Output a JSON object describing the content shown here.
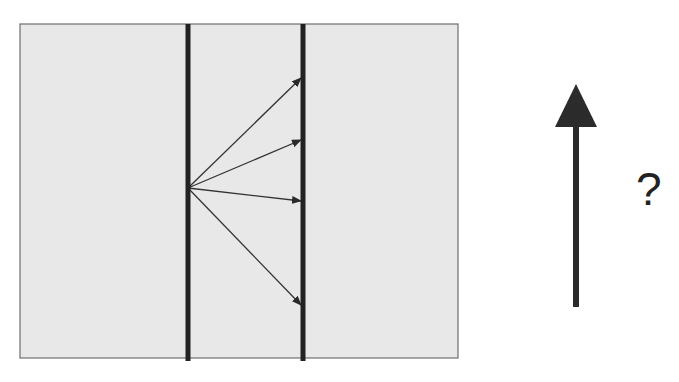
{
  "diagram": {
    "title": "",
    "colors": {
      "background": "#ffffff",
      "panel_fill": "#e8e8e8",
      "panel_border": "#6e6e6e",
      "barrier_line": "#222222",
      "ray_line": "#333333",
      "big_arrow": "#2b2b2b"
    },
    "panel": {
      "x": 20,
      "y": 24,
      "width": 438,
      "height": 334
    },
    "barriers": [
      {
        "name": "left-barrier",
        "x": 188,
        "y1": 24,
        "y2": 361
      },
      {
        "name": "right-barrier",
        "x": 303,
        "y1": 24,
        "y2": 361
      }
    ],
    "rays": {
      "origin": {
        "x": 188,
        "y": 188
      },
      "targets": [
        {
          "x": 303,
          "y": 78
        },
        {
          "x": 303,
          "y": 140
        },
        {
          "x": 303,
          "y": 201
        },
        {
          "x": 303,
          "y": 305
        }
      ]
    },
    "big_arrow": {
      "x": 576,
      "y_tail": 307,
      "y_head_base": 127,
      "y_tip": 84,
      "head_half_width": 21
    },
    "question_mark": "?"
  }
}
